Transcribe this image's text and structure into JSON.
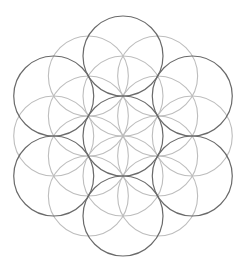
{
  "figure": {
    "colors": {
      "background": "#ffffff",
      "emphasized_stroke": "#6a6a6a",
      "light_stroke": "#bdbdbd"
    },
    "groups": [
      {
        "name": "emphasized-circles",
        "style": "dark",
        "rings": [
          {
            "distance_in_radii": 0,
            "angles_deg": [
              0
            ]
          },
          {
            "distance_in_radii": 2,
            "angles_deg": [
              90,
              30,
              -30,
              -90,
              -150,
              150
            ]
          }
        ]
      },
      {
        "name": "light-circles",
        "style": "light",
        "rings": [
          {
            "distance_in_radii": 1,
            "angles_deg": [
              90,
              30,
              -30,
              -90,
              -150,
              150
            ]
          },
          {
            "distance_in_radii": 1.7320508,
            "angles_deg": [
              0,
              60,
              120,
              180,
              240,
              300
            ]
          }
        ]
      }
    ]
  }
}
